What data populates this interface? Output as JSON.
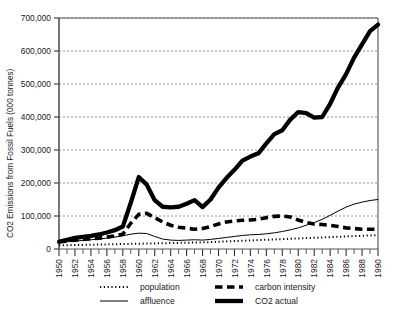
{
  "chart_data": {
    "type": "line",
    "title": "",
    "subtitle": "",
    "xlabel": "",
    "ylabel": "CO2 Emissions from Fossil Fuels (000 tonnes)",
    "xlim": [
      1950,
      1990
    ],
    "ylim": [
      0,
      700000
    ],
    "y_ticks": [
      0,
      100000,
      200000,
      300000,
      400000,
      500000,
      600000,
      700000
    ],
    "y_tick_labels": [
      "0",
      "100,000",
      "200,000",
      "300,000",
      "400,000",
      "500,000",
      "600,000",
      "700,000"
    ],
    "x_ticks": [
      1950,
      1952,
      1954,
      1956,
      1958,
      1960,
      1962,
      1964,
      1966,
      1968,
      1970,
      1972,
      1974,
      1976,
      1978,
      1980,
      1982,
      1984,
      1986,
      1988,
      1990
    ],
    "x_tick_labels": [
      "1950",
      "1952",
      "1954",
      "1956",
      "1958",
      "1960",
      "1962",
      "1964",
      "1966",
      "1968",
      "1970",
      "1972",
      "1974",
      "1976",
      "1978",
      "1980",
      "1982",
      "1984",
      "1986",
      "1988",
      "1990"
    ],
    "x_minor_tick_step": 1,
    "grid": "horizontal-dashed",
    "legend_position": "below",
    "x": [
      1950,
      1951,
      1952,
      1953,
      1954,
      1955,
      1956,
      1957,
      1958,
      1959,
      1960,
      1961,
      1962,
      1963,
      1964,
      1965,
      1966,
      1967,
      1968,
      1969,
      1970,
      1971,
      1972,
      1973,
      1974,
      1975,
      1976,
      1977,
      1978,
      1979,
      1980,
      1981,
      1982,
      1983,
      1984,
      1985,
      1986,
      1987,
      1988,
      1989,
      1990
    ],
    "series": [
      {
        "name": "population",
        "style": "dotted",
        "width": 2,
        "color": "#000000",
        "values": [
          11000,
          11500,
          12000,
          12500,
          13000,
          13500,
          14000,
          14500,
          15000,
          15500,
          16000,
          16500,
          17000,
          17500,
          18000,
          18500,
          19000,
          19500,
          20000,
          21000,
          22000,
          23000,
          24000,
          25000,
          26000,
          27000,
          28000,
          29000,
          30000,
          31000,
          32000,
          33000,
          34000,
          35000,
          36000,
          37000,
          38000,
          39000,
          40000,
          41000,
          42000
        ]
      },
      {
        "name": "affluence",
        "style": "solid-thin",
        "width": 1,
        "color": "#000000",
        "values": [
          20000,
          22000,
          24000,
          26000,
          28000,
          30000,
          33000,
          36000,
          40000,
          45000,
          48000,
          47000,
          38000,
          30000,
          27000,
          26000,
          27000,
          28000,
          27000,
          29000,
          32000,
          35000,
          38000,
          41000,
          43000,
          44000,
          46000,
          49000,
          53000,
          58000,
          64000,
          72000,
          80000,
          90000,
          102000,
          115000,
          127000,
          136000,
          142000,
          147000,
          150000
        ]
      },
      {
        "name": "carbon intensity",
        "style": "dashed",
        "width": 3.4,
        "color": "#000000",
        "values": [
          22000,
          24000,
          27000,
          29000,
          31000,
          33000,
          36000,
          40000,
          45000,
          78000,
          105000,
          108000,
          95000,
          82000,
          72000,
          66000,
          63000,
          60000,
          62000,
          68000,
          76000,
          82000,
          85000,
          87000,
          88000,
          90000,
          95000,
          99000,
          100000,
          97000,
          88000,
          80000,
          76000,
          74000,
          72000,
          68000,
          64000,
          62000,
          60000,
          60000,
          60000
        ]
      },
      {
        "name": "CO2 actual",
        "style": "solid-thick",
        "width": 4.2,
        "color": "#000000",
        "values": [
          22000,
          28000,
          34000,
          37000,
          40000,
          44000,
          50000,
          57000,
          68000,
          140000,
          218000,
          195000,
          148000,
          128000,
          126000,
          128000,
          137000,
          148000,
          127000,
          150000,
          186000,
          215000,
          240000,
          268000,
          280000,
          290000,
          320000,
          348000,
          360000,
          392000,
          415000,
          412000,
          398000,
          400000,
          440000,
          490000,
          530000,
          580000,
          620000,
          660000,
          680000
        ]
      }
    ]
  },
  "legend": {
    "entries": [
      {
        "label": "population",
        "style": "dotted"
      },
      {
        "label": "affluence",
        "style": "solid-thin"
      },
      {
        "label": "carbon intensity",
        "style": "dashed"
      },
      {
        "label": "CO2 actual",
        "style": "solid-thick"
      }
    ]
  }
}
